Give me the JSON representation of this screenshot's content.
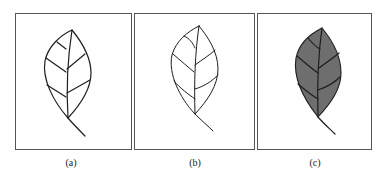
{
  "figure": {
    "panels": [
      {
        "id": "a",
        "caption": "(a)",
        "description": "leaf outline with veins",
        "fill": "none"
      },
      {
        "id": "b",
        "caption": "(b)",
        "description": "leaf outline with veins, thinner strokes",
        "fill": "none"
      },
      {
        "id": "c",
        "caption": "(c)",
        "description": "filled leaf with veins",
        "fill": "#6e6e6e"
      }
    ],
    "colors": {
      "border": "#555555",
      "stroke": "#1e1e1e",
      "leaf_fill": "#6e6e6e",
      "background": "#ffffff"
    }
  }
}
